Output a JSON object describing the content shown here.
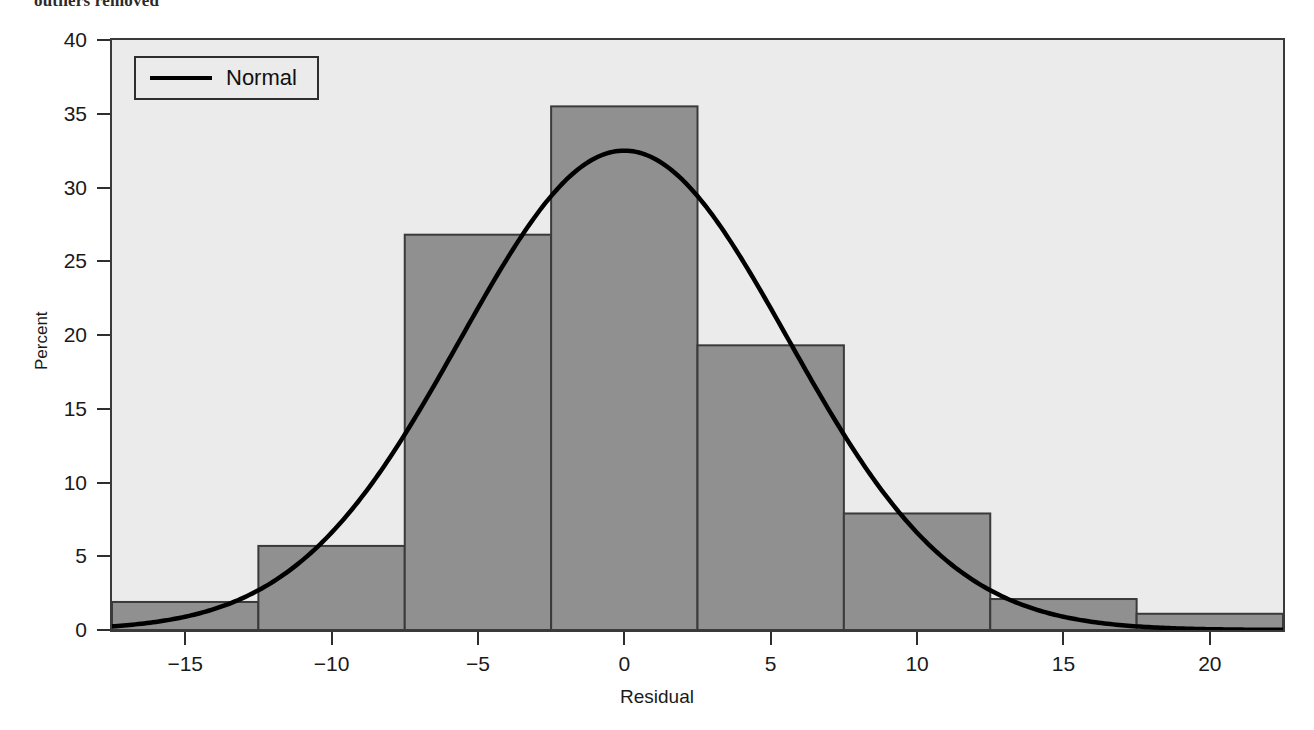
{
  "caption": "outliers removed",
  "axes": {
    "x_title": "Residual",
    "y_title": "Percent",
    "x_ticks": [
      "-15",
      "-10",
      "-5",
      "0",
      "5",
      "10",
      "15",
      "20"
    ],
    "y_ticks": [
      "0",
      "5",
      "10",
      "15",
      "20",
      "25",
      "30",
      "35",
      "40"
    ]
  },
  "legend": {
    "entries": [
      {
        "label": "Normal",
        "marker": "line",
        "color": "#000000"
      }
    ]
  },
  "style": {
    "plot_background": "#ebebeb",
    "bar_fill": "#909090",
    "bar_edge": "#3a3a3a",
    "curve_color": "#000000",
    "frame_color": "#3a3a3a"
  },
  "chart_data": {
    "type": "bar",
    "title": "outliers removed",
    "xlabel": "Residual",
    "ylabel": "Percent",
    "xlim": [
      -17.5,
      22.5
    ],
    "ylim": [
      0,
      40
    ],
    "grid": false,
    "legend_position": "upper-left",
    "bin_width": 5,
    "bin_edges": [
      -17.5,
      -12.5,
      -7.5,
      -2.5,
      2.5,
      7.5,
      12.5,
      17.5,
      22.5
    ],
    "bin_centers": [
      -15,
      -10,
      -5,
      0,
      5,
      10,
      15,
      20
    ],
    "values": [
      1.9,
      5.7,
      26.8,
      35.5,
      19.3,
      7.9,
      2.1,
      1.1
    ],
    "series": [
      {
        "name": "Histogram",
        "type": "bar",
        "values": [
          1.9,
          5.7,
          26.8,
          35.5,
          19.3,
          7.9,
          2.1,
          1.1
        ]
      },
      {
        "name": "Normal",
        "type": "line",
        "peak_value": 32.5,
        "mean": 0.0,
        "std_dev": 5.6,
        "x": [
          -17.5,
          -15,
          -12.5,
          -10,
          -7.5,
          -5,
          -2.5,
          0,
          2.5,
          5,
          7.5,
          10,
          12.5,
          15,
          17.5,
          20,
          22.5
        ],
        "y": [
          0.8,
          1.9,
          3.8,
          6.8,
          11.2,
          16.7,
          22.6,
          27.6,
          30.8,
          31.4,
          29.3,
          24.9,
          19.4,
          13.6,
          8.6,
          4.9,
          2.5
        ]
      }
    ]
  }
}
